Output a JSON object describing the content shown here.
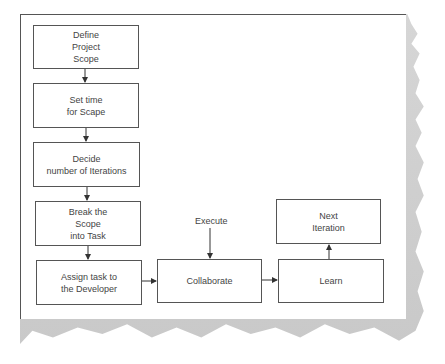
{
  "diagram": {
    "type": "flowchart",
    "nodes": {
      "define_scope": "Define\nProject\nScope",
      "set_time": "Set time\nfor Scape",
      "decide_iterations": "Decide\nnumber of Iterations",
      "break_scope": "Break the\nScope\ninto Task",
      "assign_task": "Assign task to\nthe Developer",
      "collaborate": "Collaborate",
      "learn": "Learn",
      "next_iteration": "Next\nIteration"
    },
    "labels": {
      "execute": "Execute"
    },
    "edges": [
      [
        "define_scope",
        "set_time"
      ],
      [
        "set_time",
        "decide_iterations"
      ],
      [
        "decide_iterations",
        "break_scope"
      ],
      [
        "break_scope",
        "assign_task"
      ],
      [
        "assign_task",
        "collaborate"
      ],
      [
        "execute",
        "collaborate"
      ],
      [
        "collaborate",
        "learn"
      ],
      [
        "learn",
        "next_iteration"
      ]
    ]
  }
}
